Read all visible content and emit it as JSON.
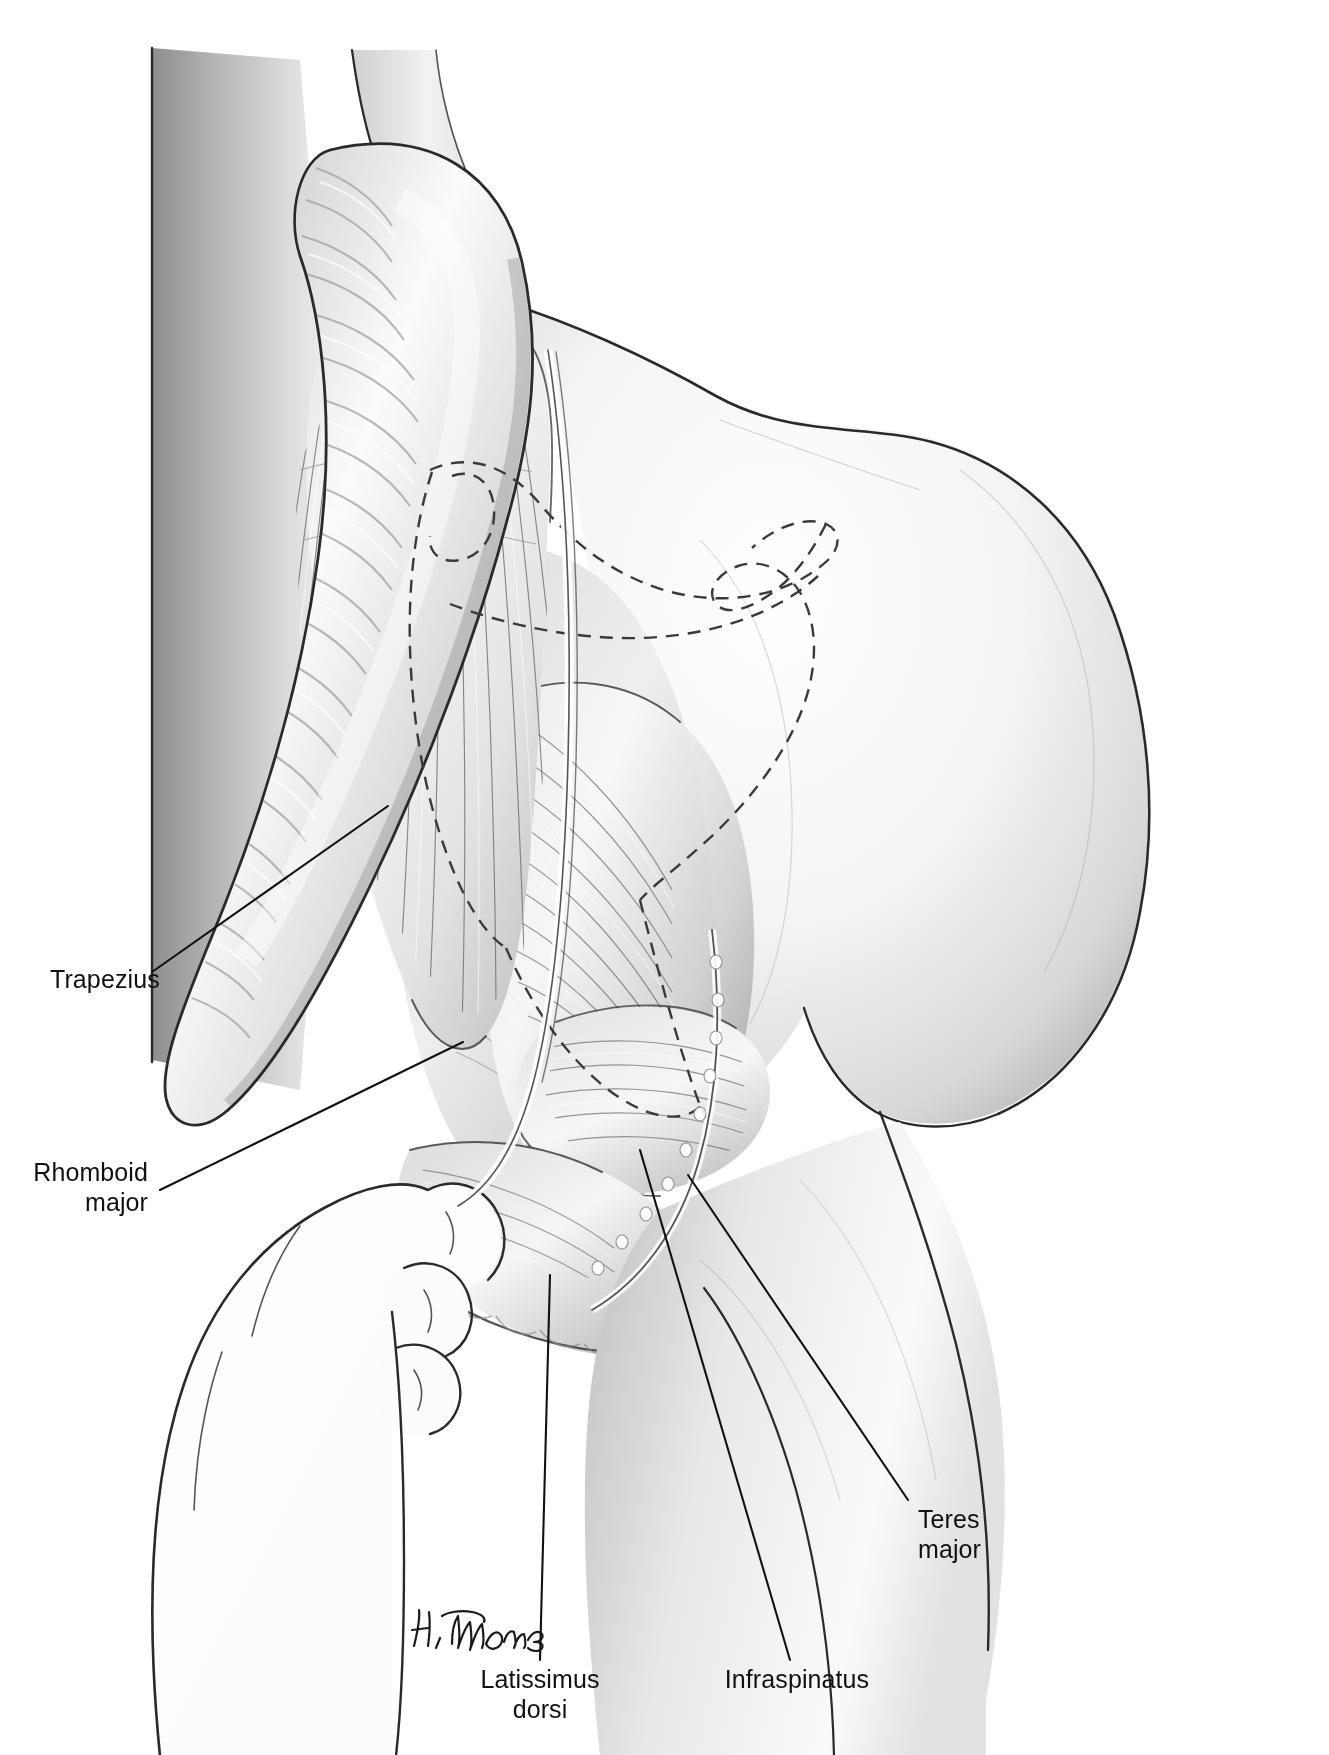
{
  "figure": {
    "kind": "anatomical-illustration",
    "background_color": "#ffffff",
    "line_color": "#111111",
    "dash_color": "#3a3a3a",
    "shading_light": "#fbfbfb",
    "shading_mid": "#c9c9c9",
    "shading_dark": "#8f8f8f"
  },
  "signature": {
    "name": "H. Thomas",
    "x": 414,
    "y": 1640
  },
  "labels": [
    {
      "id": "trapezius",
      "lines": [
        "Trapezius"
      ],
      "anchor": "start",
      "text_x": 50,
      "text_y": 988,
      "leader": [
        [
          152,
          972
        ],
        [
          388,
          806
        ]
      ],
      "interactable": false
    },
    {
      "id": "rhomboid-major",
      "lines": [
        "Rhomboid",
        "major"
      ],
      "anchor": "end",
      "text_x": 148,
      "text_y": 1181,
      "line_height": 30,
      "leader": [
        [
          160,
          1190
        ],
        [
          463,
          1042
        ]
      ],
      "interactable": false
    },
    {
      "id": "teres-major",
      "lines": [
        "Teres",
        "major"
      ],
      "anchor": "start",
      "text_x": 918,
      "text_y": 1528,
      "line_height": 30,
      "leader": [
        [
          908,
          1500
        ],
        [
          688,
          1175
        ]
      ],
      "interactable": false
    },
    {
      "id": "latissimus-dorsi",
      "lines": [
        "Latissimus",
        "dorsi"
      ],
      "anchor": "middle",
      "text_x": 540,
      "text_y": 1688,
      "line_height": 30,
      "leader": [
        [
          540,
          1660
        ],
        [
          550,
          1275
        ]
      ],
      "interactable": false
    },
    {
      "id": "infraspinatus",
      "lines": [
        "Infraspinatus"
      ],
      "anchor": "middle",
      "text_x": 797,
      "text_y": 1688,
      "leader": [
        [
          790,
          1660
        ],
        [
          640,
          1150
        ]
      ],
      "interactable": false
    }
  ]
}
